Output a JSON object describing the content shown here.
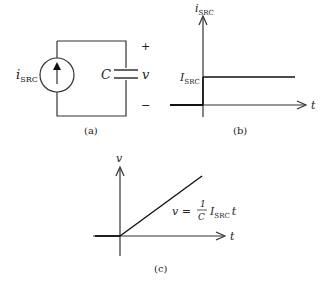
{
  "panel_a": {
    "caption": "(a)",
    "source_label": "i",
    "source_label_sub": "SRC",
    "capacitor_label": "C",
    "voltage_label": "v",
    "plus_sign": "+",
    "minus_sign": "−"
  },
  "panel_b": {
    "caption": "(b)",
    "y_axis_label": "i",
    "y_axis_label_sub": "SRC",
    "x_axis_label": "t",
    "level_label": "I",
    "level_label_sub": "SRC"
  },
  "panel_c": {
    "caption": "(c)",
    "y_axis_label": "v",
    "x_axis_label": "t",
    "eq_lhs": "v =",
    "eq_num": "1",
    "eq_den": "C",
    "eq_I": "I",
    "eq_I_sub": "SRC",
    "eq_t": "t"
  }
}
